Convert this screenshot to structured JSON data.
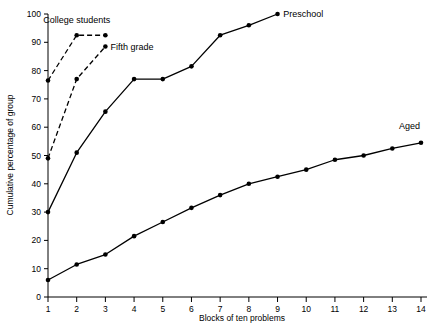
{
  "chart_data": {
    "type": "line",
    "title": "",
    "xlabel": "Blocks of ten problems",
    "ylabel": "Cumulative percentage of group",
    "xlim": [
      1,
      14
    ],
    "ylim": [
      0,
      100
    ],
    "grid": false,
    "legend_position": "inline-annotations",
    "x_ticks": [
      1,
      2,
      3,
      4,
      5,
      6,
      7,
      8,
      9,
      10,
      11,
      12,
      13,
      14
    ],
    "x_tick_labels": [
      "1",
      "2",
      "3",
      "4",
      "5",
      "6",
      "7",
      "8",
      "9",
      "10",
      "11",
      "12",
      "13",
      "14"
    ],
    "y_ticks": [
      0,
      10,
      20,
      30,
      40,
      50,
      60,
      70,
      80,
      90,
      100
    ],
    "y_tick_labels": [
      "0",
      "10",
      "20",
      "30",
      "40",
      "50",
      "60",
      "70",
      "80",
      "90",
      "100"
    ],
    "series": [
      {
        "name": "College students",
        "label": "College students",
        "style": "dashed",
        "marker": "filled-circle",
        "x": [
          1,
          2,
          3
        ],
        "values": [
          76.5,
          92.5,
          92.5
        ],
        "label_x": 2.0,
        "label_y": 98.0,
        "label_anchor": "middle"
      },
      {
        "name": "Fifth grade",
        "label": "Fifth grade",
        "style": "dashed",
        "marker": "filled-circle",
        "x": [
          1,
          2,
          3
        ],
        "values": [
          49,
          77,
          88.5
        ],
        "label_x": 3.18,
        "label_y": 88.5,
        "label_anchor": "start"
      },
      {
        "name": "Preschool",
        "label": "Preschool",
        "style": "solid",
        "marker": "filled-circle",
        "x": [
          1,
          2,
          3,
          4,
          5,
          6,
          7,
          8,
          9
        ],
        "values": [
          30,
          51,
          65.5,
          77,
          77,
          81.5,
          92.5,
          96,
          100
        ],
        "label_x": 9.2,
        "label_y": 100,
        "label_anchor": "start"
      },
      {
        "name": "Aged",
        "label": "Aged",
        "style": "solid",
        "marker": "filled-circle",
        "x": [
          1,
          2,
          3,
          4,
          5,
          6,
          7,
          8,
          9,
          10,
          11,
          12,
          13,
          14
        ],
        "values": [
          6,
          11.5,
          15,
          21.5,
          26.5,
          31.5,
          36,
          40,
          42.5,
          45,
          48.5,
          50,
          52.5,
          54.5
        ],
        "label_x": 13.6,
        "label_y": 60.5,
        "label_anchor": "middle"
      }
    ],
    "colors": {
      "line": "#000000",
      "axis": "#000000",
      "background": "#ffffff"
    }
  }
}
